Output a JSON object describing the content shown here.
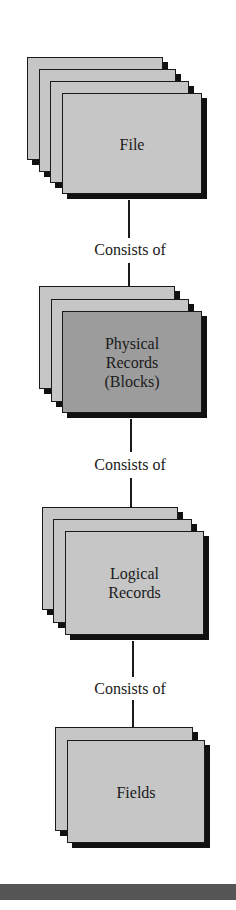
{
  "diagram": {
    "type": "hierarchy",
    "levels": [
      {
        "label": "File",
        "sheets": 4,
        "fill": "#c6c6c6"
      },
      {
        "label": "Physical\nRecords\n(Blocks)",
        "sheets": 3,
        "fill": "#9c9c9c"
      },
      {
        "label": "Logical\nRecords",
        "sheets": 3,
        "fill": "#c6c6c6"
      },
      {
        "label": "Fields",
        "sheets": 2,
        "fill": "#c6c6c6"
      }
    ],
    "relations": [
      {
        "label": "Consists of"
      },
      {
        "label": "Consists of"
      },
      {
        "label": "Consists of"
      }
    ],
    "colors": {
      "sheet_light": "#c6c6c6",
      "sheet_dark": "#9c9c9c",
      "outline": "#1a1a1a",
      "bottom_bar": "#565656"
    }
  }
}
